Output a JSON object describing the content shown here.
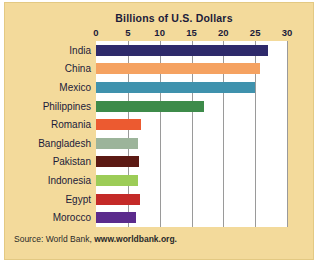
{
  "card": {
    "background_color": "#f3da9b",
    "plot_background_color": "#ffffff",
    "gridline_color": "#9a9a9a"
  },
  "source": {
    "prefix": "Source: World Bank, ",
    "url": "www.worldbank.org."
  },
  "chart_data": {
    "type": "bar",
    "orientation": "horizontal",
    "title": "Billions of U.S. Dollars",
    "xlabel": "",
    "ylabel": "",
    "xlim": [
      0,
      30
    ],
    "ticks": [
      0,
      5,
      10,
      15,
      20,
      25,
      30
    ],
    "tick_labels": [
      "0",
      "5",
      "10",
      "15",
      "20",
      "25",
      "30"
    ],
    "grid": true,
    "legend": "none",
    "categories": [
      "India",
      "China",
      "Mexico",
      "Philippines",
      "Romania",
      "Bangladesh",
      "Pakistan",
      "Indonesia",
      "Egypt",
      "Morocco"
    ],
    "values": [
      27.0,
      25.7,
      25.0,
      17.0,
      7.0,
      6.6,
      6.8,
      6.6,
      6.9,
      6.3
    ],
    "colors": [
      "#2e2a6b",
      "#f5a261",
      "#3f92ad",
      "#3d8b4a",
      "#ec5a30",
      "#9cb49a",
      "#5c1a14",
      "#9ccc57",
      "#c42a28",
      "#5b2b8c"
    ]
  }
}
